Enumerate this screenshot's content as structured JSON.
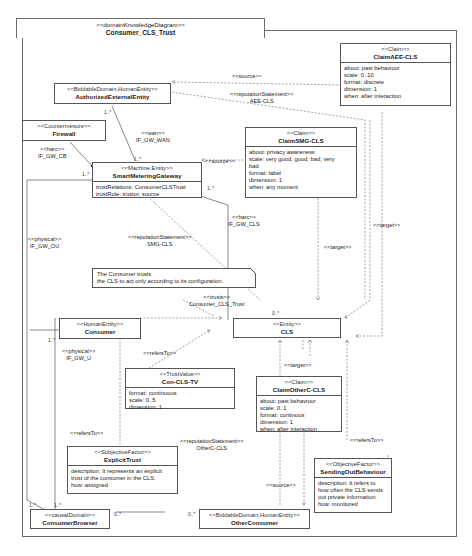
{
  "diagram": {
    "stereotype": "<<domainKnowledgeDiagram>>",
    "title": "Consumer_CLS_Trust"
  },
  "nodes": {
    "authorizedExternalEntity": {
      "stereotype": "<<BiddableDomain,HumanEntity>>",
      "name": "AuthorizedExternalEntity"
    },
    "firewall": {
      "stereotype": "<<Countermesure>>",
      "name": "Firewall"
    },
    "smartMeteringGateway": {
      "stereotype": "<<Machine,Entity>>",
      "name": "SmartMeteringGateway",
      "attributes": [
        "trustRelations: ConsumerCLSTrust",
        "trustRole: trustor, source"
      ]
    },
    "claimAEE": {
      "stereotype": "<<Claim>>",
      "name": "ClaimAEE-CLS",
      "attributes": [
        "about: past behaviour",
        "scale: 0..10",
        "format: discrete",
        "dimension: 1",
        "when: after interaction"
      ]
    },
    "claimSMG": {
      "stereotype": "<<Claim>>",
      "name": "ClaimSMG-CLS",
      "attributes": [
        "about: privacy awareness",
        "scale: very good, good, bad, very",
        "bad",
        "format: label",
        "dimension: 1",
        "when: any moment"
      ]
    },
    "note": {
      "lines": [
        "The Consumer trusts",
        "the CLS to act only according to its configuration."
      ]
    },
    "consumer": {
      "stereotype": "<<HumanEntity>>",
      "name": "Consumer"
    },
    "cls": {
      "stereotype": "<<Entity>>",
      "name": "CLS"
    },
    "conClsTv": {
      "stereotype": "<<TrustValue>>",
      "name": "Con-CLS-TV",
      "attributes": [
        "format: continuous",
        "scale: 0..5",
        "dimension: 1"
      ]
    },
    "claimOtherC": {
      "stereotype": "<<Claim>>",
      "name": "ClaimOtherC-CLS",
      "attributes": [
        "about: past behaviour",
        "scale: 0..1",
        "format: continous",
        "dimension: 1",
        "when: after interaction"
      ]
    },
    "explicitTrust": {
      "stereotype": "<<SubjectiveFactor>>",
      "name": "ExplicitTrust",
      "attributes": [
        "description: It represents an explicit",
        "trust of the consumer in the CLS.",
        "how: assigned"
      ]
    },
    "sendingOut": {
      "stereotype": "<<ObjectiveFactor>>",
      "name": "SendingOutBehaviour",
      "attributes": [
        "description: It refers to",
        "how often the CLS sends",
        "out private information",
        "how: monitored"
      ]
    },
    "consumerBrowser": {
      "stereotype": "<<causalDomain>>",
      "name": "ConsumerBrowser"
    },
    "otherConsumer": {
      "stereotype": "<<BiddableDomain,HumanEntity>>",
      "name": "OtherConsumer"
    }
  },
  "edge_labels": {
    "source_aee": "<<source>>",
    "rep_aee_st": "<<reputationStatement>>",
    "rep_aee_nm": "AEE-CLS",
    "hw_gw_cb_st": "<<harc>>",
    "hw_gw_cb_nm": "IF_GW_CB",
    "wan_st": "<<wan>>",
    "wan_nm": "IF_GW_WAN",
    "source_smg": "<<source>>",
    "hw_cls_st": "<<harc>>",
    "hw_cls_nm": "IF_GW_CLS",
    "phys_ou_st": "<<physical>>",
    "phys_ou_nm": "IF_GW_OU",
    "rep_smg_st": "<<reputationStatement>>",
    "rep_smg_nm": "SMG-CLS",
    "target_1": "<<target>>",
    "target_2": "<<target>>",
    "target_3": "<<target>>",
    "trusts_st": "<<trusts>>",
    "trusts_nm": "Consumer_CLS_Trust",
    "phys_u_st": "<<physical>>",
    "phys_u_nm": "IF_GW_U",
    "refers_1": "<<refersTo>>",
    "refers_2": "<<refersTo>>",
    "refers_3": "<<refersTo>>",
    "rep_oth_st": "<<reputationStatement>>",
    "rep_oth_nm": "OtherC-CLS",
    "source_oth": "<<source>>"
  },
  "multiplicities": {
    "aee_wan": "1..*",
    "smg_wan": "1..*",
    "smg_left": "1..*",
    "smg_right": "1..*",
    "cls_top": "0..*",
    "consumer_left": "1..*",
    "cb_left": "1..*",
    "cb_top": "1..*",
    "cb_right": "0..*",
    "oc_left": "0..*"
  }
}
